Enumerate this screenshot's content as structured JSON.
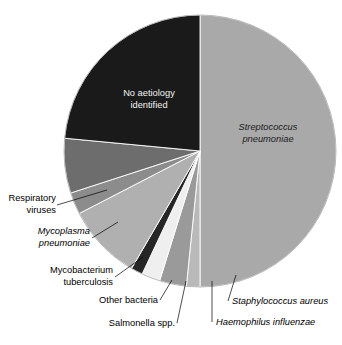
{
  "chart_data": {
    "type": "pie",
    "title": "",
    "subtitle": "",
    "xlabel": "",
    "ylabel": "",
    "legend_position": "none",
    "grid": false,
    "start_angle_deg": 0,
    "direction": "clockwise",
    "units": "percent",
    "categories": [
      "Streptococcus pneumoniae",
      "Staphylococcus aureus",
      "Haemophilus influenzae",
      "Salmonella spp.",
      "Other bacteria",
      "Mycobacterium tuberculosis",
      "Mycoplasma pneumoniae",
      "Respiratory viruses",
      "No aetiology identified"
    ],
    "values": [
      50.0,
      1.6,
      3.2,
      2.2,
      1.4,
      9.0,
      2.6,
      6.5,
      23.5
    ],
    "colors": [
      "#a9a9a9",
      "#b9b9b9",
      "#9a9a9a",
      "#efefef",
      "#262626",
      "#b0b0b0",
      "#8c8c8c",
      "#6d6d6d",
      "#1a1a1a"
    ],
    "slices": [
      {
        "label": "Streptococcus pneumoniae",
        "value": 50.0,
        "color": "#a9a9a9",
        "italic": true,
        "label_placement": "inside"
      },
      {
        "label": "Staphylococcus aureus",
        "value": 1.6,
        "color": "#b9b9b9",
        "italic": true,
        "label_placement": "callout"
      },
      {
        "label": "Haemophilus influenzae",
        "value": 3.2,
        "color": "#9a9a9a",
        "italic": true,
        "label_placement": "callout"
      },
      {
        "label": "Salmonella spp.",
        "value": 2.2,
        "color": "#efefef",
        "italic": false,
        "label_placement": "callout"
      },
      {
        "label": "Other bacteria",
        "value": 1.4,
        "color": "#262626",
        "italic": false,
        "label_placement": "callout"
      },
      {
        "label": "Mycobacterium tuberculosis",
        "value": 9.0,
        "color": "#b0b0b0",
        "italic": false,
        "label_placement": "callout"
      },
      {
        "label": "Mycoplasma pneumoniae",
        "value": 2.6,
        "color": "#8c8c8c",
        "italic": true,
        "label_placement": "callout"
      },
      {
        "label": "Respiratory viruses",
        "value": 6.5,
        "color": "#6d6d6d",
        "italic": false,
        "label_placement": "callout"
      },
      {
        "label": "No aetiology identified",
        "value": 23.5,
        "color": "#1a1a1a",
        "italic": false,
        "label_placement": "inside"
      }
    ]
  },
  "chart": {
    "geometry": {
      "cx": 200,
      "cy": 151,
      "r": 136
    },
    "inner_labels": {
      "strep_line1": "Streptococcus",
      "strep_line2": "pneumoniae",
      "noaetiology_line1": "No aetiology",
      "noaetiology_line2": "identified"
    },
    "callouts": {
      "respiratory_line1": "Respiratory",
      "respiratory_line2": "viruses",
      "mycoplasma_line1": "Mycoplasma",
      "mycoplasma_line2": "pneumoniae",
      "mycobacterium_line1": "Mycobacterium",
      "mycobacterium_line2": "tuberculosis",
      "other_bacteria": "Other bacteria",
      "salmonella": "Salmonella spp.",
      "haemophilus": "Haemophilus influenzae",
      "staphylococcus": "Staphylococcus aureus"
    }
  }
}
